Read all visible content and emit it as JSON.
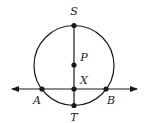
{
  "diagram": {
    "type": "geometry",
    "stroke_color": "#1a1a1a",
    "circle": {
      "center": "P",
      "cx": 74,
      "cy": 65.5,
      "r": 40
    },
    "points": [
      {
        "name": "S",
        "label": "S",
        "x": 74,
        "y": 25.5,
        "lx": 74,
        "ly": 15
      },
      {
        "name": "P",
        "label": "P",
        "x": 74,
        "y": 65,
        "lx": 84,
        "ly": 61
      },
      {
        "name": "X",
        "label": "X",
        "x": 74,
        "y": 89,
        "lx": 84,
        "ly": 84
      },
      {
        "name": "T",
        "label": "T",
        "x": 74,
        "y": 105.5,
        "lx": 74,
        "ly": 121
      },
      {
        "name": "A",
        "label": "A",
        "x": 42,
        "y": 89,
        "lx": 37,
        "ly": 104
      },
      {
        "name": "B",
        "label": "B",
        "x": 106,
        "y": 89,
        "lx": 111,
        "ly": 104
      }
    ],
    "segments": [
      {
        "from": "S",
        "to": "T"
      }
    ],
    "lines": [
      {
        "through": [
          "A",
          "X",
          "B"
        ],
        "x1": 12,
        "y1": 89,
        "x2": 137,
        "y2": 89,
        "arrows": "both"
      }
    ]
  }
}
